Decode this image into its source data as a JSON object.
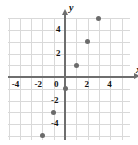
{
  "chart_data": {
    "type": "scatter",
    "title": "",
    "xlabel": "x",
    "ylabel": "y",
    "xlim": [
      -5,
      5
    ],
    "ylim": [
      -5,
      5
    ],
    "grid": true,
    "legend": "none",
    "x_ticks": [
      "-4",
      "-2",
      "0",
      "2",
      "4"
    ],
    "x_tick_values": [
      -4,
      -2,
      0,
      2,
      4
    ],
    "y_ticks": [
      "4",
      "2",
      "-2",
      "-4"
    ],
    "y_tick_values": [
      4,
      2,
      -2,
      -4
    ],
    "origin_label": "0",
    "series": [
      {
        "name": "points",
        "color": "#6b6b6b",
        "points": [
          {
            "x": -2,
            "y": -5
          },
          {
            "x": -1,
            "y": -3
          },
          {
            "x": 0,
            "y": -1
          },
          {
            "x": 1,
            "y": 1
          },
          {
            "x": 2,
            "y": 3
          },
          {
            "x": 3,
            "y": 5
          }
        ]
      }
    ]
  },
  "axes": {
    "x_name": "x",
    "y_name": "y"
  }
}
